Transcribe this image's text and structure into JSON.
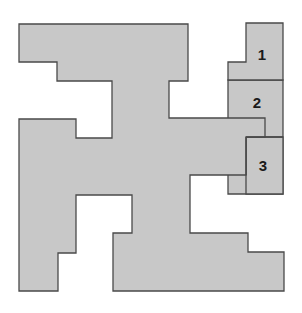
{
  "diagram": {
    "colors": {
      "fill": "#c8c8c8",
      "stroke": "#4a4a4a",
      "label": "#1a1a1a",
      "background": "#ffffff"
    },
    "main_shape": {
      "points": "19,24 188,24 188,81 169,81 169,118 265,118 265,137 246,137 246,175 190,175 190,233 248,233 248,252 284,252 284,291 113,291 113,233 132,233 132,195 76,195 76,253 58,253 58,291 19,291 19,119 76,119 76,138 112,138 112,81 57,81 57,62 19,62"
    },
    "pieces": [
      {
        "label": "1",
        "points": "246,23 283,23 283,80 228,80 228,62 246,62",
        "label_x": 262,
        "label_y": 54
      },
      {
        "label": "2",
        "points": "228,80 283,80 283,194 228,194",
        "label_x": 257,
        "label_y": 102
      },
      {
        "label": "3",
        "points": "246,137 283,137 283,194 246,194",
        "label_x": 263,
        "label_y": 165
      }
    ]
  }
}
